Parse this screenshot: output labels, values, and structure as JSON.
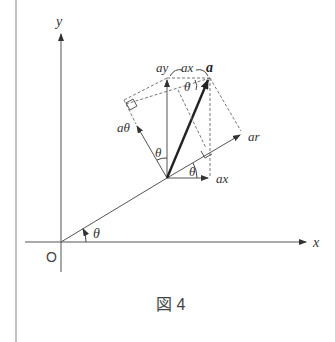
{
  "figure": {
    "caption": "図 4",
    "axes": {
      "x_label": "x",
      "y_label": "y",
      "origin_label": "O"
    },
    "angle_label": "θ",
    "vector_labels": {
      "a": "a",
      "a_x_top": "ax",
      "a_y": "ay",
      "a_x_bottom": "ax",
      "a_r": "ar",
      "a_theta": "aθ"
    },
    "angles": [
      "θ",
      "θ",
      "θ",
      "θ"
    ],
    "colors": {
      "line": "#555555",
      "vector": "#222222",
      "dashed": "#666666"
    }
  }
}
